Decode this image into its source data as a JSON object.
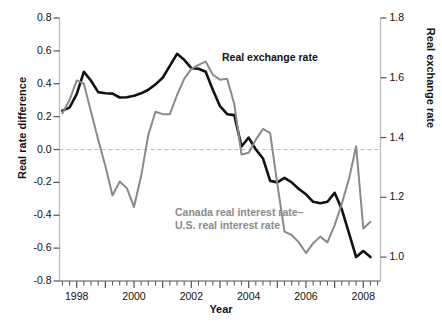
{
  "chart_data": {
    "type": "line",
    "title": "",
    "xlabel": "Year",
    "ylabel": "Real rate difference",
    "ylabel_right": "Real exchange rate",
    "xlim": [
      1997.4,
      2008.6
    ],
    "ylim": [
      -0.8,
      0.8
    ],
    "ylim_right": [
      0.92,
      1.8
    ],
    "grid": false,
    "legend_position": "inline-annotation",
    "xticks": [
      1998,
      2000,
      2002,
      2004,
      2006,
      2008
    ],
    "xtick_labels": [
      "1998",
      "2000",
      "2002",
      "2004",
      "2006",
      "2008"
    ],
    "xtick_minor_interval": 0.25,
    "yticks_left": [
      -0.8,
      -0.6,
      -0.4,
      -0.2,
      0.0,
      0.2,
      0.4,
      0.6,
      0.8
    ],
    "ytick_labels_left": [
      "-0.8",
      "-0.6",
      "-0.4",
      "-0.2",
      "0.0",
      "0.2",
      "0.4",
      "0.6",
      "0.8"
    ],
    "yticks_right": [
      1.0,
      1.2,
      1.4,
      1.6,
      1.8
    ],
    "ytick_labels_right": [
      "1.0",
      "1.2",
      "1.4",
      "1.6",
      "1.8"
    ],
    "zero_reference_line": 0.0,
    "zero_reference_style": "dashed",
    "series": [
      {
        "name": "Real exchange rate",
        "axis": "right",
        "color": "#111111",
        "width": 2.6,
        "label_text": "Real exchange rate",
        "x": [
          1997.5,
          1997.75,
          1998.0,
          1998.25,
          1998.5,
          1998.75,
          1999.0,
          1999.25,
          1999.5,
          1999.75,
          2000.0,
          2000.25,
          2000.5,
          2000.75,
          2001.0,
          2001.25,
          2001.5,
          2001.75,
          2002.0,
          2002.25,
          2002.5,
          2002.75,
          2003.0,
          2003.25,
          2003.5,
          2003.75,
          2004.0,
          2004.25,
          2004.5,
          2004.75,
          2005.0,
          2005.25,
          2005.5,
          2005.75,
          2006.0,
          2006.25,
          2006.5,
          2006.75,
          2007.0,
          2007.25,
          2007.5,
          2007.75,
          2008.0,
          2008.25
        ],
        "y": [
          1.49,
          1.5,
          1.545,
          1.62,
          1.59,
          1.552,
          1.548,
          1.547,
          1.534,
          1.535,
          1.54,
          1.548,
          1.56,
          1.578,
          1.6,
          1.64,
          1.68,
          1.66,
          1.632,
          1.63,
          1.62,
          1.56,
          1.505,
          1.478,
          1.475,
          1.37,
          1.4,
          1.36,
          1.33,
          1.255,
          1.25,
          1.265,
          1.25,
          1.228,
          1.21,
          1.185,
          1.18,
          1.185,
          1.215,
          1.16,
          1.08,
          1.0,
          1.02,
          1.0
        ]
      },
      {
        "name": "Canada real interest rate minus U.S. real interest rate",
        "axis": "left",
        "color": "#8a8a8a",
        "width": 2.0,
        "label_text": "Canada real interest rate–\nU.S. real interest rate",
        "label_line1": "Canada real interest rate–",
        "label_line2": "U.S. real interest rate",
        "x": [
          1997.5,
          1997.75,
          1998.0,
          1998.25,
          1998.5,
          1998.75,
          1999.0,
          1999.25,
          1999.5,
          1999.75,
          2000.0,
          2000.25,
          2000.5,
          2000.75,
          2001.0,
          2001.25,
          2001.5,
          2001.75,
          2002.0,
          2002.25,
          2002.5,
          2002.75,
          2003.0,
          2003.25,
          2003.5,
          2003.75,
          2004.0,
          2004.25,
          2004.5,
          2004.75,
          2005.0,
          2005.25,
          2005.5,
          2005.75,
          2006.0,
          2006.25,
          2006.5,
          2006.75,
          2007.0,
          2007.25,
          2007.5,
          2007.75,
          2008.0,
          2008.25
        ],
        "y": [
          0.22,
          0.3,
          0.42,
          0.4,
          0.23,
          0.06,
          -0.1,
          -0.28,
          -0.195,
          -0.235,
          -0.35,
          -0.16,
          0.09,
          0.23,
          0.215,
          0.215,
          0.33,
          0.43,
          0.49,
          0.515,
          0.535,
          0.455,
          0.425,
          0.43,
          0.275,
          -0.03,
          -0.02,
          0.06,
          0.125,
          0.1,
          -0.21,
          -0.5,
          -0.52,
          -0.565,
          -0.63,
          -0.57,
          -0.53,
          -0.565,
          -0.46,
          -0.33,
          -0.18,
          0.02,
          -0.48,
          -0.44
        ]
      }
    ]
  },
  "axes": {
    "left_title": "Real rate difference",
    "right_title": "Real exchange rate",
    "x_title": "Year"
  }
}
